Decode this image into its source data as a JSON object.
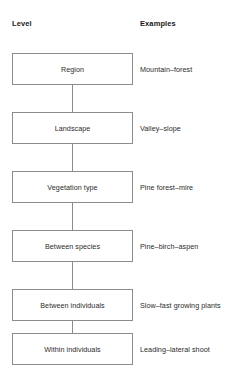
{
  "headers": {
    "level": "Level",
    "examples": "Examples"
  },
  "colors": {
    "box_border": "#8c8c8c",
    "connector": "#8c8c8c",
    "text": "#2b2b2b",
    "background": "#ffffff"
  },
  "rows": [
    {
      "level": "Region",
      "example": "Mountain–forest"
    },
    {
      "level": "Landscape",
      "example": "Valley–slope"
    },
    {
      "level": "Vegetation type",
      "example": "Pine forest–mire"
    },
    {
      "level": "Between species",
      "example": "Pine–birch–aspen"
    },
    {
      "level": "Between individuals",
      "example": "Slow–fast growing plants"
    },
    {
      "level": "Within individuals",
      "example": "Leading–lateral shoot"
    }
  ]
}
